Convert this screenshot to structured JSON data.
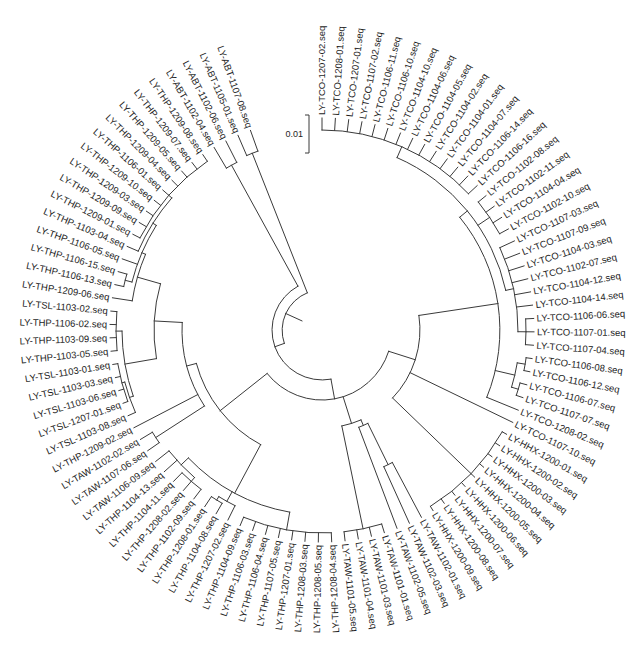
{
  "tree": {
    "scale_bar": {
      "label": "0.01"
    },
    "leaves": [
      "LY-TCO-1207-02.seq",
      "LY-TCO-1208-01.seq",
      "LY-TCO-1207-01.seq",
      "LY-TCO-1107-02.seq",
      "LY-TCO-1106-11.seq",
      "LY-TCO-1106-10.seq",
      "LY-TCO-1104-10.seq",
      "LY-TCO-1104-06.seq",
      "LY-TCO-1104-05.seq",
      "LY-TCO-1104-02.seq",
      "LY-TCO-1104-01.seq",
      "LY-TCO-1104-07.seq",
      "LY-TCO-1106-14.seq",
      "LY-TCO-1106-16.seq",
      "LY-TCO-1102-08.seq",
      "LY-TCO-1102-11.seq",
      "LY-TCO-1104-04.seq",
      "LY-TCO-1102-10.seq",
      "LY-TCO-1107-03.seq",
      "LY-TCO-1107-09.seq",
      "LY-TCO-1104-03.seq",
      "LY-TCO-1102-07.seq",
      "LY-TCO-1104-12.seq",
      "LY-TCO-1104-14.seq",
      "LY-TCO-1106-06.seq",
      "LY-TCO-1107-01.seq",
      "LY-TCO-1107-04.seq",
      "LY-TCO-1106-08.seq",
      "LY-TCO-1106-12.seq",
      "LY-TCO-1106-07.seq",
      "LY-TCO-1107-07.seq",
      "LY-TCO-1208-02.seq",
      "LY-TCO-1107-10.seq",
      "LY-HHX-1200-01.seq",
      "LY-HHX-1200-02.seq",
      "LY-HHX-1200-03.seq",
      "LY-HHX-1200-04.seq",
      "LY-HHX-1200-05.seq",
      "LY-HHX-1200-06.seq",
      "LY-HHX-1200-07.seq",
      "LY-HHX-1200-08.seq",
      "LY-HHX-1200-09.seq",
      "LY-TAW-1102-01.seq",
      "LY-TAW-1102-03.seq",
      "LY-TAW-1102-05.seq",
      "LY-TAW-1101-01.seq",
      "LY-TAW-1101-03.seq",
      "LY-TAW-1101-04.seq",
      "LY-TAW-1101-05.seq",
      "LY-THP-1208-04.seq",
      "LY-THP-1208-05.seq",
      "LY-THP-1208-03.seq",
      "LY-THP-1207-01.seq",
      "LY-THP-1107-05.seq",
      "LY-THP-1106-04.seq",
      "LY-THP-1106-03.seq",
      "LY-THP-1104-09.seq",
      "LY-THP-1207-02.seq",
      "LY-THP-1104-08.seq",
      "LY-THP-1208-01.seq",
      "LY-THP-1102-09.seq",
      "LY-THP-1208-02.seq",
      "LY-THP-1104-11.seq",
      "LY-THP-1104-13.seq",
      "LY-TAW-1106-09.seq",
      "LY-TAW-1107-06.seq",
      "LY-TAW-1102-02.seq",
      "LY-THP-1209-02.seq",
      "LY-TSL-1103-08.seq",
      "LY-TSL-1207-01.seq",
      "LY-TSL-1103-06.seq",
      "LY-TSL-1103-03.seq",
      "LY-TSL-1103-01.seq",
      "LY-THP-1103-05.seq",
      "LY-THP-1103-09.seq",
      "LY-THP-1106-02.seq",
      "LY-TSL-1103-02.seq",
      "LY-THP-1209-06.seq",
      "LY-THP-1106-13.seq",
      "LY-THP-1106-15.seq",
      "LY-THP-1106-05.seq",
      "LY-THP-1103-04.seq",
      "LY-THP-1209-01.seq",
      "LY-THP-1209-09.seq",
      "LY-THP-1209-03.seq",
      "LY-THP-1209-10.seq",
      "LY-THP-1106-01.seq",
      "LY-THP-1209-04.seq",
      "LY-THP-1209-05.seq",
      "LY-THP-1209-07.seq",
      "LY-THP-1209-08.seq",
      "LY-ABT-1102-04.seq",
      "LY-ABT-1102-06.seq",
      "LY-ABT-1105-01.seq",
      "LY-ABT-1107-08.seq"
    ],
    "structure": {
      "r": 40,
      "c": [
        {
          "r": 50,
          "c": [
            {
              "r": 188,
              "c": [
                91,
                92
              ]
            },
            {
              "r": 70,
              "c": [
                {
                  "r": 130,
                  "c": [
                    {
                      "r": 140,
                      "c": [
                        {
                          "r": 168,
                          "c": [
                            {
                              "r": 192,
                              "c": [
                                77,
                                {
                                  "r": 196,
                                  "c": [
                                    {
                                      "r": 203,
                                      "c": [
                                        78,
                                        79
                                      ]
                                    },
                                    80,
                                    {
                                      "r": 200,
                                      "c": [
                                        81,
                                        {
                                          "r": 204,
                                          "c": [
                                            82,
                                            83,
                                            84,
                                            85,
                                            86,
                                            87,
                                            88,
                                            89,
                                            90
                                          ]
                                        }
                                      ]
                                    }
                                  ]
                                }
                              ]
                            },
                            {
                              "r": 200,
                              "c": [
                                {
                                  "r": 204,
                                  "c": [
                                    68,
                                    {
                                      "r": 207,
                                      "c": [
                                        69,
                                        70,
                                        71,
                                        72
                                      ]
                                    }
                                  ]
                                },
                                {
                                  "r": 206,
                                  "c": [
                                    73,
                                    74,
                                    75,
                                    76
                                  ]
                                }
                              ]
                            }
                          ]
                        },
                        67,
                        {
                          "r": 198,
                          "c": [
                            65,
                            66
                          ]
                        }
                      ]
                    },
                    {
                      "r": 185,
                      "c": [
                        {
                          "r": 195,
                          "c": [
                            64,
                            63,
                            {
                              "r": 200,
                              "c": [
                                60,
                                61,
                                62
                              ]
                            }
                          ]
                        },
                        {
                          "r": 196,
                          "c": [
                            {
                              "r": 200,
                              "c": [
                                58,
                                59
                              ]
                            },
                            57
                          ]
                        },
                        {
                          "r": 203,
                          "c": [
                            49,
                            50,
                            51,
                            52,
                            53,
                            54,
                            55,
                            56
                          ]
                        }
                      ]
                    }
                  ]
                },
                {
                  "r": 98,
                  "c": [
                    {
                      "r": 104,
                      "c": [
                        {
                          "r": 150,
                          "c": [
                            42,
                            43
                          ]
                        },
                        44
                      ]
                    },
                    {
                      "r": 203,
                      "c": [
                        45,
                        46,
                        47,
                        48
                      ]
                    }
                  ]
                },
                {
                  "r": 98,
                  "c": [
                    {
                      "r": 178,
                      "c": [
                        {
                          "r": 188,
                          "c": [
                            {
                              "r": 200,
                              "c": [
                                0,
                                1,
                                2,
                                3,
                                4,
                                5,
                                6,
                                7,
                                8,
                                9,
                                10,
                                11,
                                12,
                                13
                              ]
                            },
                            {
                              "r": 202,
                              "c": [
                                14,
                                15,
                                16,
                                17
                              ]
                            },
                            {
                              "r": 196,
                              "c": [
                                18,
                                19,
                                20,
                                21,
                                22,
                                23,
                                {
                                  "r": 204,
                                  "c": [
                                    24,
                                    25,
                                    26
                                  ]
                                }
                              ]
                            }
                          ]
                        },
                        {
                          "r": 198,
                          "c": [
                            {
                              "r": 206,
                              "c": [
                                27,
                                28
                              ]
                            },
                            {
                              "r": 205,
                              "c": [
                                29,
                                30
                              ]
                            }
                          ]
                        },
                        31
                      ]
                    },
                    32,
                    {
                      "r": 207,
                      "c": [
                        33,
                        34,
                        35,
                        36,
                        37,
                        38,
                        39,
                        40,
                        41
                      ]
                    }
                  ]
                }
              ]
            }
          ]
        },
        {
          "r": 190,
          "c": [
            93,
            94
          ]
        }
      ]
    }
  }
}
